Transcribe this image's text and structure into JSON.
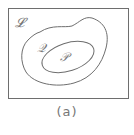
{
  "diagram": {
    "type": "set-inclusion",
    "sets": [
      {
        "id": "L",
        "label": "𝓛",
        "shape": "rectangle",
        "role": "universe"
      },
      {
        "id": "Q",
        "label": "𝒬",
        "shape": "blob",
        "contained_in": "L"
      },
      {
        "id": "P",
        "label": "𝒫",
        "shape": "ellipse",
        "contained_in": "Q"
      }
    ],
    "caption": "(a)",
    "colors": {
      "stroke": "#6e6e6e",
      "label": "#777777"
    }
  }
}
